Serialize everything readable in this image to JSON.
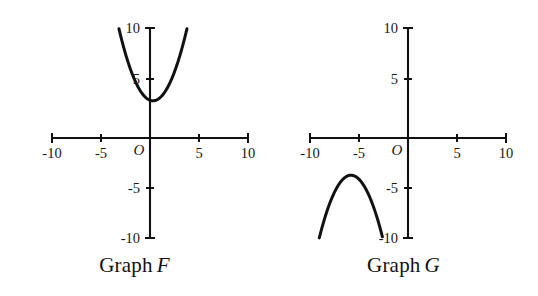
{
  "figure": {
    "background_color": "#ffffff",
    "ink_color": "#111111",
    "panels": [
      {
        "id": "graph-f",
        "caption_prefix": "Graph",
        "caption_name": "F",
        "origin_label": "O",
        "x_ticks": [
          {
            "value": -10,
            "label": "-10"
          },
          {
            "value": -5,
            "label": "-5"
          },
          {
            "value": 5,
            "label": "5"
          },
          {
            "value": 10,
            "label": "10"
          }
        ],
        "y_ticks": [
          {
            "value": 10,
            "label": "10"
          },
          {
            "value": 5,
            "label": "5"
          },
          {
            "value": -5,
            "label": "-5"
          },
          {
            "value": -10,
            "label": "-10"
          }
        ]
      },
      {
        "id": "graph-g",
        "caption_prefix": "Graph",
        "caption_name": "G",
        "origin_label": "O",
        "x_ticks": [
          {
            "value": -10,
            "label": "-10"
          },
          {
            "value": -5,
            "label": "-5"
          },
          {
            "value": 5,
            "label": "5"
          },
          {
            "value": 10,
            "label": "10"
          }
        ],
        "y_ticks": [
          {
            "value": 10,
            "label": "10"
          },
          {
            "value": 5,
            "label": "5"
          },
          {
            "value": -5,
            "label": "-5"
          },
          {
            "value": -10,
            "label": "-10"
          }
        ]
      }
    ]
  },
  "chart_data": [
    {
      "type": "line",
      "title": "Graph F",
      "xlabel": "",
      "ylabel": "",
      "xlim": [
        -10,
        10
      ],
      "ylim": [
        -10,
        10
      ],
      "grid": false,
      "legend": "none",
      "curve": {
        "name": "upward parabola",
        "shape": "parabola opening upward",
        "vertex": [
          0.3,
          3.4
        ],
        "leading_coefficient": 0.55,
        "equation": "y = 0.55(x - 0.3)^2 + 3.4",
        "x": [
          -3.8,
          -3.2,
          -2.6,
          -2.0,
          -1.4,
          -0.8,
          -0.2,
          0.3,
          0.9,
          1.5,
          2.1,
          2.7,
          3.3,
          3.8
        ],
        "y": [
          13.0,
          10.2,
          7.9,
          6.0,
          4.7,
          4.0,
          3.6,
          3.4,
          3.6,
          4.1,
          5.2,
          6.6,
          8.4,
          10.2
        ]
      },
      "axes": {
        "x_ticks": [
          -10,
          -5,
          5,
          10
        ],
        "y_ticks": [
          10,
          5,
          -5,
          -10
        ],
        "x_tick_labels": [
          "-10",
          "-5",
          "5",
          "10"
        ],
        "y_tick_labels": [
          "10",
          "5",
          "-5",
          "-10"
        ],
        "origin_label": "O"
      }
    },
    {
      "type": "line",
      "title": "Graph G",
      "xlabel": "",
      "ylabel": "",
      "xlim": [
        -10,
        10
      ],
      "ylim": [
        -10,
        10
      ],
      "grid": false,
      "legend": "none",
      "curve": {
        "name": "downward parabola",
        "shape": "parabola opening downward",
        "vertex": [
          -5.8,
          -3.4
        ],
        "leading_coefficient": -0.55,
        "equation": "y = -0.55(x + 5.8)^2 - 3.4",
        "x": [
          -9.2,
          -8.6,
          -8.0,
          -7.4,
          -6.8,
          -6.2,
          -5.8,
          -5.2,
          -4.6,
          -4.0,
          -3.4,
          -3.0
        ],
        "y": [
          -10.2,
          -7.3,
          -5.8,
          -4.8,
          -4.0,
          -3.5,
          -3.4,
          -3.6,
          -4.2,
          -5.2,
          -6.6,
          -7.7
        ]
      },
      "axes": {
        "x_ticks": [
          -10,
          -5,
          5,
          10
        ],
        "y_ticks": [
          10,
          5,
          -5,
          -10
        ],
        "x_tick_labels": [
          "-10",
          "-5",
          "5",
          "10"
        ],
        "y_tick_labels": [
          "10",
          "5",
          "-5",
          "-10"
        ],
        "origin_label": "O"
      }
    }
  ]
}
